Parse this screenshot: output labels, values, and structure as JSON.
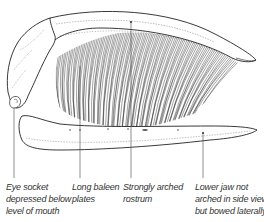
{
  "figure": {
    "colors": {
      "line": "#222222",
      "background": "#ffffff",
      "text": "#333333"
    }
  },
  "labels": [
    {
      "id": "eye-socket",
      "lines": [
        "Eye socket",
        "depressed below",
        "level of mouth"
      ],
      "x": 6,
      "pointer_x": 14
    },
    {
      "id": "baleen-plates",
      "lines": [
        "Long baleen",
        "plates"
      ],
      "x": 72,
      "pointer_x": 80
    },
    {
      "id": "rostrum",
      "lines": [
        "Strongly arched",
        "rostrum"
      ],
      "x": 123,
      "pointer_x": 131
    },
    {
      "id": "lower-jaw",
      "lines": [
        "Lower jaw not",
        "arched in side view,",
        "but bowed laterally"
      ],
      "x": 195,
      "pointer_x": 203
    }
  ]
}
